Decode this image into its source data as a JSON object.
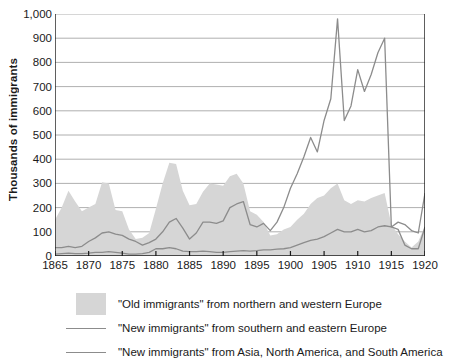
{
  "chart_data": {
    "type": "area",
    "title": "",
    "xlabel": "",
    "ylabel": "Thousands of immigrants",
    "xlim": [
      1865,
      1920
    ],
    "ylim": [
      0,
      1000
    ],
    "grid": true,
    "legend_position": "bottom-left",
    "ytick_labels": [
      "1,000",
      "900",
      "800",
      "700",
      "600",
      "500",
      "400",
      "300",
      "200",
      "100",
      "0"
    ],
    "ytick_values": [
      1000,
      900,
      800,
      700,
      600,
      500,
      400,
      300,
      200,
      100,
      0
    ],
    "xtick_labels": [
      "1865",
      "1870",
      "1875",
      "1880",
      "1885",
      "1890",
      "1895",
      "1900",
      "1905",
      "1910",
      "1915",
      "1920"
    ],
    "xtick_values": [
      1865,
      1870,
      1875,
      1880,
      1885,
      1890,
      1895,
      1900,
      1905,
      1910,
      1915,
      1920
    ],
    "colors": {
      "area_fill": "#d6d6d6",
      "line": "#8c8c8c",
      "grid": "#9a9a9a",
      "axis": "#1a1a1a"
    },
    "x": [
      1865,
      1866,
      1867,
      1868,
      1869,
      1870,
      1871,
      1872,
      1873,
      1874,
      1875,
      1876,
      1877,
      1878,
      1879,
      1880,
      1881,
      1882,
      1883,
      1884,
      1885,
      1886,
      1887,
      1888,
      1889,
      1890,
      1891,
      1892,
      1893,
      1894,
      1895,
      1896,
      1897,
      1898,
      1899,
      1900,
      1901,
      1902,
      1903,
      1904,
      1905,
      1906,
      1907,
      1908,
      1909,
      1910,
      1911,
      1912,
      1913,
      1914,
      1915,
      1916,
      1917,
      1918,
      1919,
      1920
    ],
    "series": [
      {
        "name": "\"Old immigrants\" from northern and western Europe",
        "type": "area",
        "values": [
          150,
          200,
          270,
          225,
          185,
          200,
          215,
          305,
          300,
          190,
          185,
          110,
          70,
          75,
          95,
          195,
          300,
          385,
          380,
          270,
          210,
          215,
          265,
          300,
          295,
          290,
          330,
          340,
          300,
          185,
          170,
          140,
          85,
          90,
          110,
          120,
          150,
          175,
          215,
          240,
          250,
          280,
          300,
          230,
          215,
          230,
          225,
          240,
          250,
          260,
          130,
          90,
          60,
          35,
          60,
          125
        ]
      },
      {
        "name": "\"New immigrants\" from southern and eastern Europe",
        "type": "line",
        "values": [
          35,
          35,
          40,
          35,
          40,
          60,
          75,
          95,
          100,
          90,
          85,
          70,
          60,
          45,
          55,
          70,
          100,
          140,
          155,
          115,
          70,
          95,
          140,
          140,
          135,
          145,
          200,
          215,
          225,
          130,
          120,
          135,
          105,
          140,
          200,
          280,
          340,
          410,
          490,
          430,
          560,
          650,
          980,
          560,
          620,
          770,
          680,
          750,
          840,
          900,
          120,
          140,
          130,
          105,
          95,
          260
        ]
      },
      {
        "name": "\"New immigrants\" from Asia, North America, and South America",
        "type": "line",
        "values": [
          8,
          10,
          12,
          10,
          10,
          12,
          15,
          15,
          18,
          15,
          12,
          8,
          8,
          10,
          15,
          30,
          30,
          35,
          30,
          20,
          18,
          18,
          20,
          18,
          15,
          15,
          18,
          20,
          22,
          20,
          22,
          25,
          25,
          28,
          30,
          35,
          45,
          55,
          65,
          70,
          80,
          95,
          110,
          100,
          100,
          110,
          100,
          105,
          120,
          125,
          120,
          110,
          45,
          30,
          30,
          120
        ]
      }
    ]
  },
  "legend": {
    "items": [
      {
        "key": "area",
        "label": "\"Old immigrants\" from northern and western Europe"
      },
      {
        "key": "line",
        "label": "\"New immigrants\" from southern and eastern Europe"
      },
      {
        "key": "line",
        "label": "\"New immigrants\" from Asia, North America, and South America"
      }
    ]
  }
}
